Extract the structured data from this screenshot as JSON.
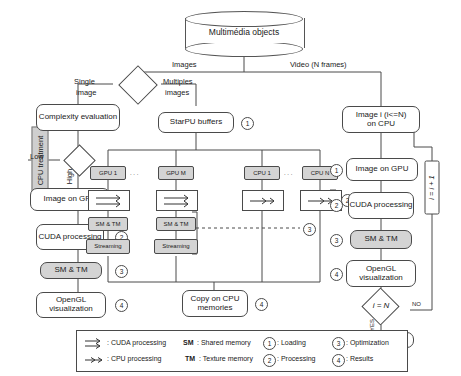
{
  "source": {
    "label": "Multimédia objects"
  },
  "branches": {
    "images": "Images",
    "video": "Video (N frames)",
    "single": "Single",
    "single2": "image",
    "multiple": "Multiples",
    "multiple2": "images"
  },
  "left": {
    "side_label": "CPU treatment",
    "complexity": "Complexity evaluation",
    "low": "Low",
    "high": "High",
    "image_gpu": "Image on GPU",
    "n1": "1",
    "cuda": "CUDA processing",
    "n2": "2",
    "smtm": "SM & TM",
    "n3": "3",
    "opengl": "OpenGL visualization",
    "n4": "4"
  },
  "middle": {
    "starpu": "StarPU buffers",
    "n1": "1",
    "gpu_first": "GPU 1",
    "gpu_dots": ". . .",
    "gpu_last": "GPU M",
    "cpu_first": "CPU 1",
    "cpu_dots": ". . .",
    "cpu_last": "CPU N",
    "smtm": "SM & TM",
    "streaming": "Streaming",
    "n2": "2",
    "n3": "3",
    "copy": "Copy on CPU memories",
    "n4": "4"
  },
  "right": {
    "image_i": "Image i (i<=N)",
    "image_i2": "on CPU",
    "image_gpu": "Image on GPU",
    "n1": "1",
    "cuda": "CUDA processing",
    "n2": "2",
    "smtm": "SM & TM",
    "n3": "3",
    "opengl": "OpenGL visualization",
    "n4": "4",
    "decision": "i = N",
    "no": "NO",
    "yes": "YES",
    "increment": "i = i + 1",
    "end": "END"
  },
  "legend": {
    "cuda": ": CUDA processing",
    "cpu": ": CPU processing",
    "sm": "SM",
    "sm_def": ": Shared memory",
    "tm": "TM",
    "tm_def": ": Texture memory",
    "n1": "1",
    "n1_def": ": Loading",
    "n2": "2",
    "n2_def": ": Processing",
    "n3": "3",
    "n3_def": ": Optimization",
    "n4": "4",
    "n4_def": ": Results"
  }
}
